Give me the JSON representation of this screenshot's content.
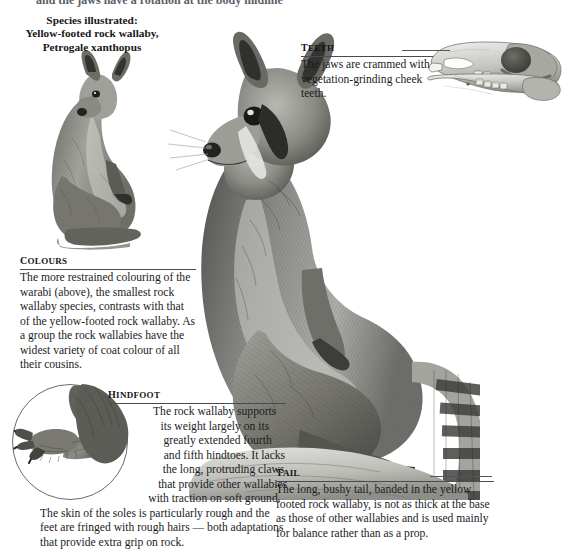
{
  "page": {
    "top_partial_line": "and the jaws have a rotation at the body midline",
    "background_color": "#ffffff",
    "ink_color": "#1b1b1e"
  },
  "caption": {
    "line1": "Species illustrated:",
    "line2": "Yellow-footed rock wallaby,",
    "line3": "Petrogale xanthopus"
  },
  "sections": [
    {
      "id": "teeth",
      "heading": "Teeth",
      "body": "The jaws are crammed with vegetation-grinding cheek teeth."
    },
    {
      "id": "colours",
      "heading": "Colours",
      "body": "The more restrained colouring of the warabi (above), the smallest rock wallaby species, contrasts with that of the yellow-footed rock wallaby. As a group the rock wallabies have the widest variety of coat colour of all their cousins."
    },
    {
      "id": "hindfoot",
      "heading": "Hindfoot",
      "body": "The rock wallaby supports its weight largely on its greatly extended fourth and fifth hindtoes. It lacks the long, protruding claws that provide other wallabies with traction on soft ground. The skin of the soles is particularly rough and the feet are fringed with rough hairs — both adaptations that provide extra grip on rock."
    },
    {
      "id": "tail",
      "heading": "Tail",
      "body": "The long, bushy tail, banded in the yellow footed rock wallaby, is not as thick at the base as those of other wallabies and is used mainly for balance rather than as a prop."
    }
  ],
  "illustrations": [
    {
      "id": "main-wallaby",
      "name": "yellow-footed-rock-wallaby-illustration"
    },
    {
      "id": "small-wallaby",
      "name": "warabi-rock-wallaby-illustration"
    },
    {
      "id": "skull",
      "name": "wallaby-skull-illustration"
    },
    {
      "id": "hindfoot-art",
      "name": "hindfoot-detail-illustration"
    },
    {
      "id": "tail-art",
      "name": "banded-tail-illustration"
    }
  ]
}
